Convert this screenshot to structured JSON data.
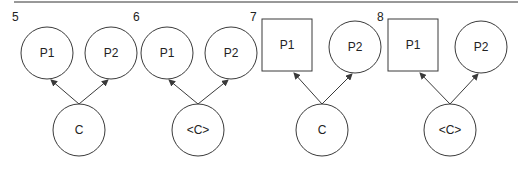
{
  "diagram": {
    "type": "parent-child graphs",
    "panels": [
      {
        "number": "5",
        "parents": [
          {
            "label": "P1",
            "shape": "circle"
          },
          {
            "label": "P2",
            "shape": "circle"
          }
        ],
        "child": {
          "label": "C",
          "shape": "circle"
        }
      },
      {
        "number": "6",
        "parents": [
          {
            "label": "P1",
            "shape": "circle"
          },
          {
            "label": "P2",
            "shape": "circle"
          }
        ],
        "child": {
          "label": "<C>",
          "shape": "circle"
        }
      },
      {
        "number": "7",
        "parents": [
          {
            "label": "P1",
            "shape": "square"
          },
          {
            "label": "P2",
            "shape": "circle"
          }
        ],
        "child": {
          "label": "C",
          "shape": "circle"
        }
      },
      {
        "number": "8",
        "parents": [
          {
            "label": "P1",
            "shape": "square"
          },
          {
            "label": "P2",
            "shape": "circle"
          }
        ],
        "child": {
          "label": "<C>",
          "shape": "circle"
        }
      }
    ],
    "edges": "child → each parent (arrowheads at parents)",
    "colors": {
      "stroke": "#3a3a3a",
      "text": "#222222",
      "background": "#ffffff"
    }
  }
}
